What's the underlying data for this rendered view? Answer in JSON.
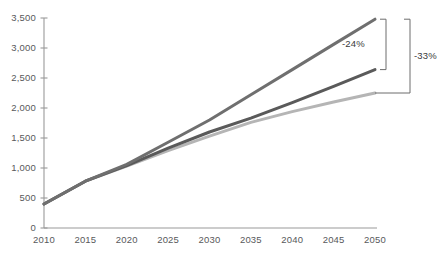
{
  "chart_data": {
    "type": "line",
    "title": "",
    "subtitle": "",
    "xlabel": "",
    "ylabel": "",
    "x": [
      2010,
      2015,
      2020,
      2025,
      2030,
      2035,
      2040,
      2045,
      2050
    ],
    "categories": [
      "2010",
      "2015",
      "2020",
      "2025",
      "2030",
      "2035",
      "2040",
      "2045",
      "2050"
    ],
    "xlim": [
      2008,
      2051
    ],
    "ylim": [
      0,
      3500
    ],
    "y_ticks": [
      0,
      500,
      1000,
      1500,
      2000,
      2500,
      3000,
      3500
    ],
    "y_tick_labels": [
      "0",
      "500",
      "1,000",
      "1,500",
      "2,000",
      "2,500",
      "3,000",
      "3,500"
    ],
    "x_tick_labels": [
      "2010",
      "2015",
      "2020",
      "2025",
      "2030",
      "2035",
      "2040",
      "2045",
      "2050"
    ],
    "grid": false,
    "legend": "none",
    "series": [
      {
        "name": "upper-line",
        "color": "#6f6f6f",
        "values": [
          400,
          780,
          1060,
          1430,
          1800,
          2220,
          2640,
          3060,
          3480
        ]
      },
      {
        "name": "middle-line",
        "color": "#5a5a5a",
        "values": [
          400,
          780,
          1040,
          1330,
          1600,
          1830,
          2090,
          2360,
          2640
        ]
      },
      {
        "name": "lower-line",
        "color": "#b5b5b5",
        "values": [
          400,
          780,
          1030,
          1290,
          1530,
          1760,
          1940,
          2100,
          2250
        ]
      }
    ],
    "annotations": [
      {
        "label": "-24%",
        "from_series": "upper-line",
        "to_series": "middle-line",
        "at_x": 2050,
        "type": "bracket-delta"
      },
      {
        "label": "-33%",
        "from_series": "upper-line",
        "to_series": "lower-line",
        "at_x": 2050,
        "type": "bracket-delta"
      }
    ],
    "axis_color": "#9a9a9a"
  }
}
